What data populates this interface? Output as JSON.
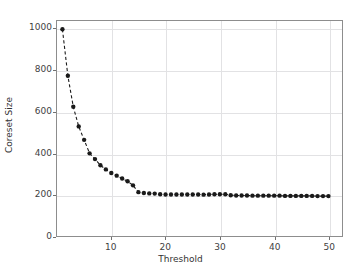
{
  "chart_data": {
    "type": "line",
    "title": "",
    "xlabel": "Threshold",
    "ylabel": "Coreset Size",
    "xlim": [
      0,
      52.5
    ],
    "ylim": [
      0,
      1040
    ],
    "grid": true,
    "legend": null,
    "marker": "circle",
    "linestyle": "dashed",
    "color": "#1a1a1a",
    "xticks": [
      10,
      20,
      30,
      40,
      50
    ],
    "yticks": [
      0,
      200,
      400,
      600,
      800,
      1000
    ],
    "xticklabels": [
      "10",
      "20",
      "30",
      "40",
      "50"
    ],
    "yticklabels": [
      "0",
      "200",
      "400",
      "600",
      "800",
      "1000"
    ],
    "series": [
      {
        "name": "Coreset Size vs Threshold",
        "x": [
          1,
          2,
          3,
          4,
          5,
          6,
          7,
          8,
          9,
          10,
          11,
          12,
          13,
          14,
          15,
          16,
          17,
          18,
          19,
          20,
          21,
          22,
          23,
          24,
          25,
          26,
          27,
          28,
          29,
          30,
          31,
          32,
          33,
          34,
          35,
          36,
          37,
          38,
          39,
          40,
          41,
          42,
          43,
          44,
          45,
          46,
          47,
          48,
          49,
          50
        ],
        "values": [
          1000,
          775,
          625,
          530,
          465,
          400,
          372,
          342,
          322,
          305,
          292,
          278,
          265,
          245,
          212,
          208,
          206,
          205,
          202,
          201,
          201,
          201,
          201,
          201,
          201,
          201,
          200,
          201,
          202,
          202,
          202,
          197,
          196,
          196,
          196,
          195,
          195,
          195,
          195,
          195,
          195,
          194,
          194,
          194,
          194,
          194,
          194,
          193,
          193,
          193
        ]
      }
    ]
  },
  "axes": {
    "x_axis_name": "threshold-axis",
    "y_axis_name": "coreset-size-axis"
  }
}
